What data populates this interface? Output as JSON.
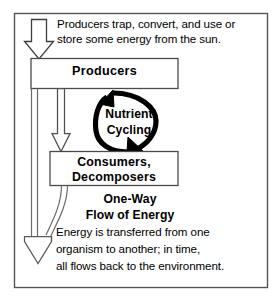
{
  "diagram": {
    "title_caption": {
      "line1": "Producers trap, convert, and use or",
      "line2": "store some energy from the sun."
    },
    "boxes": {
      "producers": {
        "label": "Producers"
      },
      "consumers": {
        "line1": "Consumers,",
        "line2": "Decomposers"
      }
    },
    "cycle": {
      "line1": "Nutrient",
      "line2": "Cycling"
    },
    "energy_flow": {
      "heading_line1": "One-Way",
      "heading_line2": "Flow of Energy",
      "body_line1": "Energy is transferred from one",
      "body_line2": "organism to another; in time,",
      "body_line3": "all flows back to the environment."
    },
    "icons": {
      "sun_input_arrow": "down-arrow-icon",
      "producers_to_consumers_arrow": "down-arrow-icon",
      "energy_loss_arrow": "large-down-arrow-icon",
      "nutrient_cycle_arrow": "circular-arrow-icon"
    },
    "colors": {
      "stroke": "#000000",
      "background": "#ffffff",
      "text": "#000000",
      "frame": "#4f4f4f"
    }
  }
}
